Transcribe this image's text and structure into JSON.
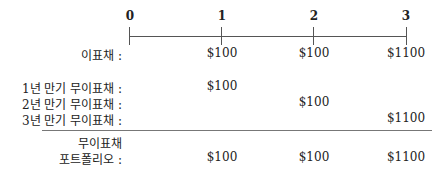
{
  "timeline": {
    "ticks": [
      "0",
      "1",
      "2",
      "3"
    ]
  },
  "coupon_bond": {
    "label": "이표채 :",
    "cashflows": [
      "$100",
      "$100",
      "$1100"
    ]
  },
  "zero_bonds": [
    {
      "label": "1년 만기 무이표채 :",
      "cashflow": "$100",
      "period": 1
    },
    {
      "label": "2년 만기 무이표채 :",
      "cashflow": "$100",
      "period": 2
    },
    {
      "label": "3년 만기 무이표채 :",
      "cashflow": "$1100",
      "period": 3
    }
  ],
  "portfolio": {
    "label_line1": "무이표채",
    "label_line2": "포트폴리오 :",
    "cashflows": [
      "$100",
      "$100",
      "$1100"
    ]
  }
}
